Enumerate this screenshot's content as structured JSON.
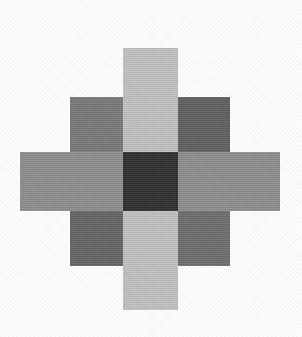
{
  "figure": {
    "background_color": "#fdfdfd",
    "canvas": {
      "width": 302,
      "height": 337
    }
  },
  "chart_data": {
    "type": "heatmap",
    "subtitle": "",
    "xlabel": "",
    "ylabel": "",
    "grid": false,
    "legend": "none",
    "columns": [
      "left",
      "center",
      "right"
    ],
    "rows": [
      "top",
      "middle",
      "bottom"
    ],
    "cells": [
      {
        "id": "top-arm",
        "row": "top",
        "col": "center",
        "color": "#c3c3c3",
        "value": 195,
        "x": 123,
        "y": 48,
        "width": 55,
        "height": 104
      },
      {
        "id": "top-left",
        "row": "top",
        "col": "left",
        "color": "#7a7a7a",
        "value": 122,
        "x": 70,
        "y": 97,
        "width": 53,
        "height": 55
      },
      {
        "id": "top-right",
        "row": "top",
        "col": "right",
        "color": "#606060",
        "value": 96,
        "x": 178,
        "y": 97,
        "width": 52,
        "height": 55
      },
      {
        "id": "left-arm",
        "row": "middle",
        "col": "left",
        "color": "#8f8f8f",
        "value": 143,
        "x": 20,
        "y": 152,
        "width": 103,
        "height": 59
      },
      {
        "id": "center",
        "row": "middle",
        "col": "center",
        "color": "#2e2e2e",
        "value": 46,
        "x": 123,
        "y": 152,
        "width": 55,
        "height": 59
      },
      {
        "id": "right-arm",
        "row": "middle",
        "col": "right",
        "color": "#8f8f8f",
        "value": 143,
        "x": 178,
        "y": 152,
        "width": 102,
        "height": 59
      },
      {
        "id": "bottom-left",
        "row": "bottom",
        "col": "left",
        "color": "#656565",
        "value": 101,
        "x": 70,
        "y": 211,
        "width": 53,
        "height": 55
      },
      {
        "id": "bottom-arm",
        "row": "bottom",
        "col": "center",
        "color": "#c3c3c3",
        "value": 195,
        "x": 123,
        "y": 211,
        "width": 55,
        "height": 99
      },
      {
        "id": "bottom-right",
        "row": "bottom",
        "col": "right",
        "color": "#6e6e6e",
        "value": 110,
        "x": 178,
        "y": 211,
        "width": 52,
        "height": 55
      }
    ]
  }
}
